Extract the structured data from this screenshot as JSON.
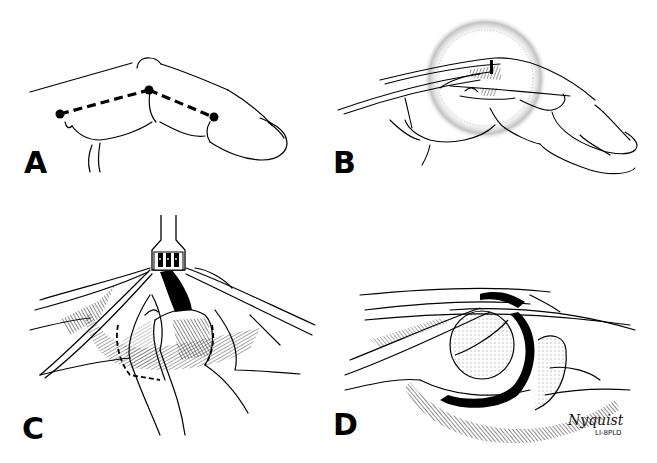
{
  "figure": {
    "panels": [
      {
        "id": "A",
        "label": "A",
        "content": "Lateral view of flexed finger with dashed incision line connecting three dots across the joint"
      },
      {
        "id": "B",
        "label": "B",
        "content": "Lateral view of finger with tendons and ligaments; stippled circle highlights the joint region"
      },
      {
        "id": "C",
        "label": "C",
        "content": "Retractor holding skin flaps open while forceps lift tissue; dashed outline marks ligament to release"
      },
      {
        "id": "D",
        "label": "D",
        "content": "Exposed joint showing condyle and dark joint space beneath retracted structures"
      }
    ],
    "signature": {
      "name": "Nyquist",
      "subtext": "LI-8PLD"
    },
    "colors": {
      "ink": "#000000",
      "background": "#ffffff",
      "stipple": "#555555"
    }
  }
}
